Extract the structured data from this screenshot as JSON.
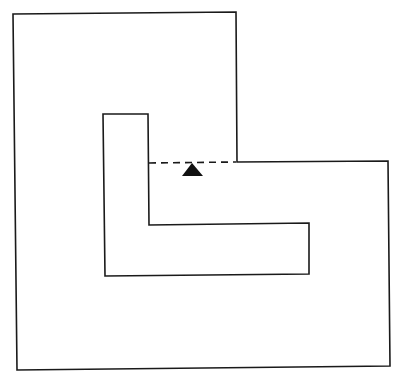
{
  "diagram": {
    "colors": {
      "stroke": "#1a1a1a",
      "marker": "#111111",
      "background": "#ffffff"
    },
    "elements": [
      {
        "name": "outer-boundary",
        "shape": "L-polygon"
      },
      {
        "name": "inner-obstacle",
        "shape": "L-polygon"
      },
      {
        "name": "dashed-opening",
        "shape": "dashed-line"
      },
      {
        "name": "position-marker",
        "shape": "filled-triangle"
      }
    ]
  }
}
